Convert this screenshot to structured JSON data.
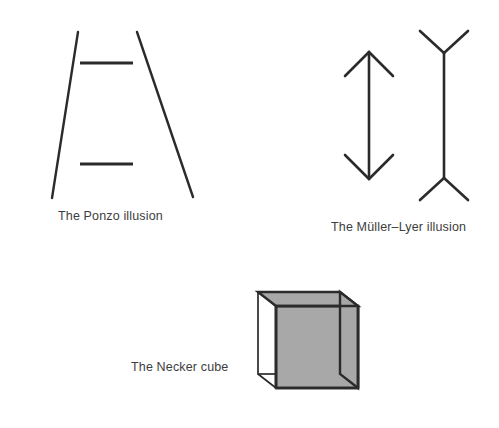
{
  "page": {
    "background_color": "#ffffff",
    "stroke_color": "#2b2b2b",
    "text_color": "#3d3d3d",
    "shade_color": "#a8a8a8",
    "width": 499,
    "height": 428
  },
  "figures": [
    {
      "id": "ponzo",
      "name": "The Ponzo illusion",
      "caption": "The Ponzo illusion",
      "description": "Two converging oblique lines with two equal horizontal bars between them",
      "elements": {
        "left_rail": {
          "x1": 78,
          "y1": 32,
          "x2": 52,
          "y2": 198
        },
        "right_rail": {
          "x1": 137,
          "y1": 32,
          "x2": 193,
          "y2": 197
        },
        "top_bar": {
          "x1": 80,
          "y1": 63,
          "x2": 133,
          "y2": 63
        },
        "bottom_bar": {
          "x1": 80,
          "y1": 164,
          "x2": 133,
          "y2": 164
        }
      }
    },
    {
      "id": "muller-lyer",
      "name": "The Müller–Lyer illusion",
      "caption": "The Müller–Lyer illusion",
      "description": "Two equal vertical shafts, one with inward arrowheads and one with outward fins",
      "elements": {
        "inward_shaft": {
          "x": 369,
          "y1": 52,
          "y2": 179
        },
        "inward_fin_length": 26,
        "outward_shaft": {
          "x": 444,
          "y1": 53,
          "y2": 178
        },
        "outward_fin_length": 26
      }
    },
    {
      "id": "necker-cube",
      "name": "The Necker cube",
      "caption": "The Necker cube",
      "description": "A wireframe cube with one square face shaded grey",
      "elements": {
        "front_face": {
          "x": 276,
          "y": 306,
          "size": 82
        },
        "back_face": {
          "x": 258,
          "y": 292,
          "size": 82
        },
        "shaded_face": "front"
      }
    }
  ]
}
